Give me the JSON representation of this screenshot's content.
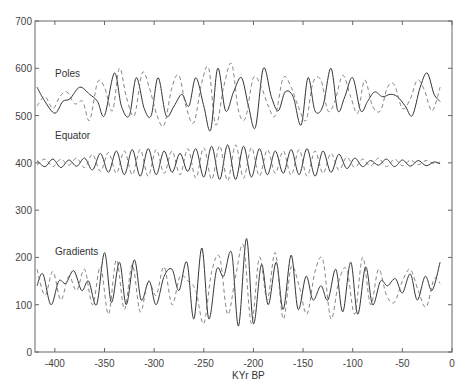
{
  "chart_data": {
    "type": "line",
    "title": "",
    "xlabel": "KYr BP",
    "ylabel": "",
    "xlim": [
      -420,
      0
    ],
    "ylim": [
      0,
      700
    ],
    "xticks": [
      -400,
      -350,
      -300,
      -250,
      -200,
      -150,
      -100,
      -50,
      0
    ],
    "yticks": [
      0,
      100,
      200,
      300,
      400,
      500,
      600,
      700
    ],
    "grid": false,
    "legend": "none (inline labels)",
    "annotations": [
      {
        "text": "Poles",
        "x": -410,
        "y": 590
      },
      {
        "text": "Equator",
        "x": -410,
        "y": 440
      },
      {
        "text": "Gradients",
        "x": -410,
        "y": 190
      }
    ],
    "series": [
      {
        "name": "Poles (solid)",
        "style": "solid",
        "baseline": 540,
        "x": [
          -418,
          -410,
          -400,
          -392,
          -385,
          -375,
          -365,
          -357,
          -350,
          -340,
          -333,
          -325,
          -318,
          -310,
          -303,
          -296,
          -288,
          -280,
          -272,
          -265,
          -258,
          -250,
          -243,
          -236,
          -228,
          -220,
          -212,
          -205,
          -198,
          -190,
          -182,
          -175,
          -168,
          -160,
          -152,
          -145,
          -138,
          -130,
          -122,
          -115,
          -108,
          -100,
          -92,
          -85,
          -78,
          -70,
          -62,
          -55,
          -47,
          -40,
          -32,
          -25,
          -18,
          -12
        ],
        "y": [
          560,
          530,
          505,
          530,
          535,
          560,
          545,
          530,
          500,
          590,
          520,
          500,
          580,
          515,
          500,
          580,
          500,
          520,
          545,
          520,
          580,
          520,
          470,
          600,
          510,
          550,
          580,
          520,
          475,
          600,
          540,
          510,
          550,
          540,
          480,
          580,
          510,
          520,
          600,
          510,
          540,
          580,
          510,
          530,
          550,
          540,
          545,
          540,
          520,
          500,
          560,
          590,
          545,
          530
        ]
      },
      {
        "name": "Poles (dashed)",
        "style": "dashed",
        "baseline": 540,
        "x": [
          -418,
          -410,
          -402,
          -395,
          -388,
          -380,
          -372,
          -365,
          -357,
          -350,
          -342,
          -335,
          -328,
          -320,
          -312,
          -305,
          -297,
          -290,
          -282,
          -275,
          -268,
          -260,
          -252,
          -245,
          -238,
          -230,
          -222,
          -215,
          -208,
          -200,
          -192,
          -185,
          -178,
          -170,
          -162,
          -155,
          -147,
          -140,
          -132,
          -125,
          -118,
          -110,
          -102,
          -95,
          -88,
          -80,
          -72,
          -65,
          -58,
          -50,
          -42,
          -35,
          -28,
          -20,
          -12
        ],
        "y": [
          520,
          540,
          515,
          540,
          550,
          525,
          530,
          490,
          570,
          560,
          510,
          600,
          540,
          500,
          590,
          560,
          500,
          480,
          560,
          585,
          520,
          485,
          570,
          600,
          480,
          560,
          610,
          510,
          495,
          580,
          560,
          520,
          500,
          580,
          560,
          520,
          490,
          570,
          575,
          510,
          530,
          585,
          540,
          505,
          575,
          520,
          510,
          560,
          565,
          515,
          535,
          575,
          555,
          510,
          560
        ]
      },
      {
        "name": "Equator (solid)",
        "style": "solid",
        "baseline": 400,
        "x": [
          -418,
          -410,
          -402,
          -394,
          -386,
          -378,
          -370,
          -362,
          -354,
          -346,
          -338,
          -330,
          -322,
          -314,
          -306,
          -298,
          -290,
          -282,
          -274,
          -266,
          -258,
          -250,
          -242,
          -234,
          -226,
          -218,
          -210,
          -202,
          -194,
          -186,
          -178,
          -170,
          -162,
          -154,
          -146,
          -138,
          -130,
          -122,
          -114,
          -106,
          -98,
          -90,
          -82,
          -74,
          -66,
          -58,
          -50,
          -42,
          -34,
          -26,
          -18,
          -12
        ],
        "y": [
          405,
          392,
          408,
          390,
          406,
          393,
          410,
          385,
          420,
          380,
          425,
          375,
          428,
          372,
          430,
          375,
          425,
          380,
          420,
          382,
          430,
          370,
          435,
          365,
          438,
          365,
          435,
          370,
          430,
          375,
          425,
          378,
          428,
          375,
          430,
          372,
          425,
          380,
          418,
          388,
          410,
          392,
          405,
          395,
          408,
          392,
          406,
          393,
          405,
          394,
          402,
          398
        ]
      },
      {
        "name": "Equator (dashed)",
        "style": "dashed",
        "baseline": 400,
        "x": [
          -418,
          -410,
          -402,
          -394,
          -386,
          -378,
          -370,
          -362,
          -354,
          -346,
          -338,
          -330,
          -322,
          -314,
          -306,
          -298,
          -290,
          -282,
          -274,
          -266,
          -258,
          -250,
          -242,
          -234,
          -226,
          -218,
          -210,
          -202,
          -194,
          -186,
          -178,
          -170,
          -162,
          -154,
          -146,
          -138,
          -130,
          -122,
          -114,
          -106,
          -98,
          -90,
          -82,
          -74,
          -66,
          -58,
          -50,
          -42,
          -34,
          -26,
          -18,
          -12
        ],
        "y": [
          395,
          408,
          392,
          408,
          395,
          410,
          390,
          418,
          382,
          422,
          378,
          425,
          375,
          428,
          372,
          428,
          378,
          425,
          375,
          430,
          368,
          432,
          365,
          436,
          362,
          438,
          368,
          432,
          372,
          428,
          378,
          425,
          374,
          428,
          372,
          425,
          378,
          420,
          385,
          412,
          390,
          408,
          393,
          410,
          392,
          408,
          394,
          406,
          396,
          405,
          398,
          402
        ]
      },
      {
        "name": "Gradients (solid)",
        "style": "solid",
        "baseline": 140,
        "x": [
          -418,
          -412,
          -404,
          -396,
          -389,
          -381,
          -373,
          -366,
          -358,
          -350,
          -343,
          -335,
          -328,
          -320,
          -313,
          -305,
          -298,
          -290,
          -282,
          -275,
          -267,
          -260,
          -252,
          -245,
          -237,
          -230,
          -222,
          -215,
          -207,
          -200,
          -192,
          -185,
          -177,
          -170,
          -162,
          -155,
          -147,
          -140,
          -132,
          -125,
          -117,
          -110,
          -102,
          -95,
          -87,
          -80,
          -72,
          -65,
          -57,
          -50,
          -42,
          -35,
          -27,
          -20,
          -12
        ],
        "y": [
          140,
          165,
          100,
          150,
          145,
          172,
          130,
          150,
          100,
          210,
          105,
          190,
          100,
          195,
          110,
          150,
          100,
          160,
          175,
          130,
          190,
          70,
          220,
          70,
          175,
          160,
          210,
          55,
          240,
          60,
          185,
          100,
          190,
          90,
          205,
          90,
          160,
          110,
          140,
          110,
          175,
          85,
          190,
          80,
          180,
          100,
          150,
          140,
          155,
          125,
          165,
          110,
          160,
          130,
          190
        ]
      },
      {
        "name": "Gradients (dashed)",
        "style": "dashed",
        "baseline": 140,
        "x": [
          -418,
          -410,
          -402,
          -394,
          -386,
          -378,
          -370,
          -362,
          -354,
          -346,
          -338,
          -330,
          -322,
          -314,
          -306,
          -298,
          -290,
          -282,
          -274,
          -266,
          -258,
          -250,
          -242,
          -234,
          -226,
          -218,
          -210,
          -202,
          -194,
          -186,
          -178,
          -170,
          -162,
          -154,
          -146,
          -138,
          -130,
          -122,
          -114,
          -106,
          -98,
          -90,
          -82,
          -74,
          -66,
          -58,
          -50,
          -42,
          -34,
          -26,
          -18,
          -12
        ],
        "y": [
          175,
          120,
          170,
          110,
          160,
          130,
          175,
          100,
          180,
          80,
          195,
          90,
          185,
          85,
          150,
          120,
          180,
          100,
          160,
          150,
          130,
          60,
          170,
          200,
          80,
          160,
          225,
          60,
          200,
          110,
          210,
          70,
          180,
          140,
          80,
          170,
          195,
          70,
          150,
          175,
          80,
          200,
          100,
          175,
          120,
          105,
          150,
          175,
          130,
          95,
          155,
          145
        ]
      }
    ]
  },
  "axes": {
    "x_tick_labels": [
      "-400",
      "-350",
      "-300",
      "-250",
      "-200",
      "-150",
      "-100",
      "-50",
      "0"
    ],
    "y_tick_labels": [
      "0",
      "100",
      "200",
      "300",
      "400",
      "500",
      "600",
      "700"
    ],
    "x_title": "KYr BP"
  },
  "labels": {
    "poles": "Poles",
    "equator": "Equator",
    "gradients": "Gradients"
  },
  "colors": {
    "line": "#333333",
    "axis": "#666666"
  }
}
